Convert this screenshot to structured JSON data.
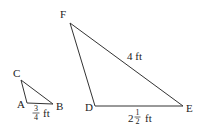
{
  "diagram": {
    "stroke_color": "#333333",
    "small_triangle": {
      "vertices": {
        "C": {
          "label": "C",
          "x": 21,
          "y": 80
        },
        "A": {
          "label": "A",
          "x": 27,
          "y": 103
        },
        "B": {
          "label": "B",
          "x": 53,
          "y": 104
        }
      },
      "side_AB": {
        "whole": "",
        "numerator": "3",
        "denominator": "4",
        "unit": "ft"
      }
    },
    "large_triangle": {
      "vertices": {
        "F": {
          "label": "F",
          "x": 70,
          "y": 23
        },
        "D": {
          "label": "D",
          "x": 95,
          "y": 106
        },
        "E": {
          "label": "E",
          "x": 183,
          "y": 106
        }
      },
      "side_FE": {
        "text": "4 ft"
      },
      "side_DE": {
        "whole": "2",
        "numerator": "1",
        "denominator": "2",
        "unit": "ft"
      }
    }
  }
}
